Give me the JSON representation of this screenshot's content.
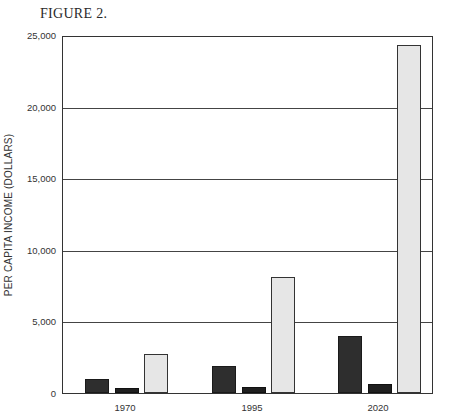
{
  "title": "FIGURE 2.",
  "chart_data": {
    "type": "bar",
    "title": "FIGURE 2.",
    "xlabel": "",
    "ylabel": "PER CAPITA INCOME (DOLLARS)",
    "categories": [
      "1970",
      "1995",
      "2020"
    ],
    "series": [
      {
        "name": "Series 1 (dark)",
        "values": [
          980,
          1890,
          3990
        ]
      },
      {
        "name": "Series 2 (black, small)",
        "values": [
          350,
          420,
          630
        ]
      },
      {
        "name": "Series 3 (light stippled)",
        "values": [
          2730,
          8120,
          24440
        ]
      }
    ],
    "ylim": [
      0,
      25000
    ],
    "yticks": [
      0,
      5000,
      10000,
      15000,
      20000,
      25000
    ],
    "ytick_labels": [
      "0",
      "5,000",
      "10,000",
      "15,000",
      "20,000",
      "25,000"
    ],
    "grid": true,
    "legend": "none"
  }
}
